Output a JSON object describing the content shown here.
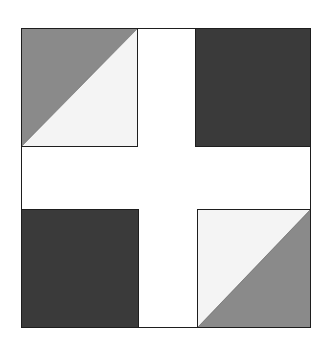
{
  "diagram": {
    "type": "quilt-block-pattern",
    "frame": {
      "border_color": "#1e1e1e",
      "background": "#ffffff"
    },
    "colors": {
      "dark": "#3a3a3a",
      "medium": "#8a8a8a",
      "light": "#f4f4f4",
      "sashing": "#ffffff",
      "outline": "#1e1e1e"
    },
    "blocks": [
      {
        "position": "top-left",
        "kind": "half-square-triangle",
        "dark_half": "upper-left",
        "light_half": "lower-right"
      },
      {
        "position": "top-right",
        "kind": "solid",
        "fill": "dark"
      },
      {
        "position": "bottom-left",
        "kind": "solid",
        "fill": "dark"
      },
      {
        "position": "bottom-right",
        "kind": "half-square-triangle",
        "dark_half": "lower-right",
        "light_half": "upper-left"
      }
    ]
  }
}
